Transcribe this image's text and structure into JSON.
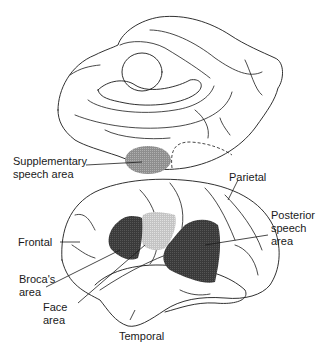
{
  "figure": {
    "views": [
      {
        "name": "medial-view",
        "description": "Medial surface of hemisphere"
      },
      {
        "name": "lateral-view",
        "description": "Lateral surface of left hemisphere"
      }
    ],
    "labels": {
      "supplementary": [
        "Supplementary",
        "speech area"
      ],
      "parietal": "Parietal",
      "posterior": [
        "Posterior",
        "speech",
        "area"
      ],
      "frontal": "Frontal",
      "broca": [
        "Broca's",
        "area"
      ],
      "face": [
        "Face",
        "area"
      ],
      "temporal": "Temporal"
    },
    "colors": {
      "outline": "#1a1a1a",
      "dark_region": "#3a3a3a",
      "medium_region": "#9a9a9a",
      "light_region": "#c8c8c8",
      "background": "#ffffff"
    }
  }
}
